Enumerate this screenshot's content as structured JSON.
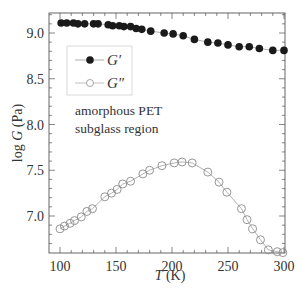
{
  "chart_data": {
    "type": "line",
    "title": "",
    "xlabel_var": "T",
    "xlabel_unit": " (K)",
    "ylabel_prefix": "log ",
    "ylabel_var": "G",
    "ylabel_unit": " (Pa)",
    "xlim": [
      90,
      300
    ],
    "ylim": [
      6.6,
      9.22
    ],
    "xticks": [
      100,
      150,
      200,
      250,
      300
    ],
    "xtick_labels": [
      "100",
      "150",
      "200",
      "250",
      "300"
    ],
    "yticks": [
      7.0,
      7.5,
      8.0,
      8.5,
      9.0
    ],
    "ytick_labels": [
      "7.0",
      "7.5",
      "8.0",
      "8.5",
      "9.0"
    ],
    "grid": false,
    "legend_position": "upper left",
    "annotations": [
      "amorphous PET",
      "subglass region"
    ],
    "series": [
      {
        "name": "G′",
        "marker": "filled-circle",
        "color": "#1a1a1a",
        "x": [
          101,
          106,
          112,
          116,
          122,
          130,
          134,
          143,
          147,
          153,
          157,
          163,
          168,
          173,
          181,
          193,
          201,
          210,
          220,
          232,
          241,
          250,
          260,
          269,
          278,
          290,
          300
        ],
        "y": [
          9.11,
          9.11,
          9.11,
          9.1,
          9.1,
          9.1,
          9.1,
          9.09,
          9.08,
          9.08,
          9.07,
          9.07,
          9.05,
          9.04,
          9.02,
          9.0,
          8.99,
          8.97,
          8.93,
          8.9,
          8.89,
          8.87,
          8.85,
          8.85,
          8.83,
          8.81,
          8.81
        ]
      },
      {
        "name": "G″",
        "marker": "open-circle",
        "color": "#8a8a8a",
        "x": [
          100,
          104,
          109,
          113,
          119,
          124,
          129,
          140,
          146,
          151,
          156,
          163,
          174,
          180,
          191,
          202,
          209,
          218,
          232,
          242,
          249,
          262,
          267,
          272,
          279,
          286,
          294,
          299
        ],
        "y": [
          6.86,
          6.89,
          6.92,
          6.95,
          6.99,
          7.05,
          7.08,
          7.21,
          7.25,
          7.29,
          7.35,
          7.38,
          7.46,
          7.5,
          7.55,
          7.58,
          7.59,
          7.58,
          7.48,
          7.37,
          7.26,
          7.08,
          6.96,
          6.86,
          6.74,
          6.63,
          6.61,
          6.6
        ]
      }
    ]
  },
  "legend": {
    "items": [
      {
        "label_main": "G",
        "label_prime": "′"
      },
      {
        "label_main": "G",
        "label_prime": "″"
      }
    ]
  },
  "annotation": {
    "line1": "amorphous PET",
    "line2": "subglass region"
  }
}
